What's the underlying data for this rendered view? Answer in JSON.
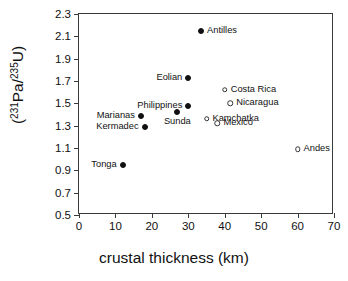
{
  "chart_data": {
    "type": "scatter",
    "title": "",
    "xlabel": "crustal thickness (km)",
    "ylabel": "(231Pa/235U)",
    "ylabel_parts": {
      "open_paren": "(",
      "sup1": "231",
      "mid": "Pa/",
      "sup2": "235",
      "tail": "U)"
    },
    "xlim": [
      0,
      70
    ],
    "ylim": [
      0.5,
      2.3
    ],
    "xticks": [
      0,
      10,
      20,
      30,
      40,
      50,
      60,
      70
    ],
    "xtick_labels": [
      "0",
      "10",
      "20",
      "30",
      "40",
      "50",
      "60",
      "70"
    ],
    "yticks": [
      0.5,
      0.7,
      0.9,
      1.1,
      1.3,
      1.5,
      1.7,
      1.9,
      2.1,
      2.3
    ],
    "ytick_labels": [
      "0.5",
      "0.7",
      "0.9",
      "1.1",
      "1.3",
      "1.5",
      "1.7",
      "1.9",
      "2.1",
      "2.3"
    ],
    "grid": false,
    "legend": "none",
    "marker_styles": {
      "filled": "filled-circle",
      "open": "open-circle"
    },
    "points": [
      {
        "name": "Antilles",
        "x": 33.5,
        "y": 2.15,
        "marker": "filled",
        "label_pos": "right"
      },
      {
        "name": "Eolian",
        "x": 30.0,
        "y": 1.73,
        "marker": "filled",
        "label_pos": "left"
      },
      {
        "name": "Costa Rica",
        "x": 40.0,
        "y": 1.62,
        "marker": "open",
        "label_pos": "right"
      },
      {
        "name": "Nicaragua",
        "x": 41.5,
        "y": 1.5,
        "marker": "open",
        "label_pos": "right"
      },
      {
        "name": "Philippines",
        "x": 30.0,
        "y": 1.48,
        "marker": "filled",
        "label_pos": "left"
      },
      {
        "name": "Sunda",
        "x": 27.0,
        "y": 1.42,
        "marker": "filled",
        "label_pos": "below"
      },
      {
        "name": "Marianas",
        "x": 17.0,
        "y": 1.39,
        "marker": "filled",
        "label_pos": "left"
      },
      {
        "name": "Kamchatka",
        "x": 35.0,
        "y": 1.36,
        "marker": "open",
        "label_pos": "right"
      },
      {
        "name": "Mexico",
        "x": 38.0,
        "y": 1.32,
        "marker": "open",
        "label_pos": "right"
      },
      {
        "name": "Kermadec",
        "x": 18.0,
        "y": 1.29,
        "marker": "filled",
        "label_pos": "left"
      },
      {
        "name": "Andes",
        "x": 60.0,
        "y": 1.09,
        "marker": "open",
        "label_pos": "right"
      },
      {
        "name": "Tonga",
        "x": 12.0,
        "y": 0.95,
        "marker": "filled",
        "label_pos": "left"
      }
    ]
  },
  "colors": {
    "axis": "#3a3a3a",
    "text": "#111111",
    "marker_fill": "#111111",
    "marker_open_stroke": "#333333",
    "background": "#ffffff"
  }
}
